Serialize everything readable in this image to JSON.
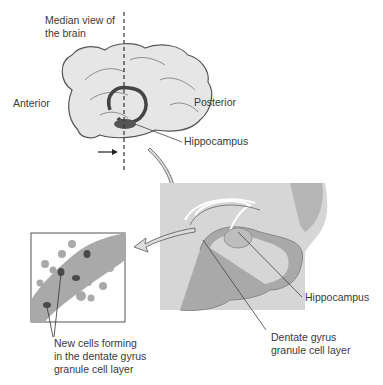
{
  "labels": {
    "median_view": [
      "Median view of",
      "the brain"
    ],
    "anterior": "Anterior",
    "posterior": "Posterior",
    "hippocampus_brain": "Hippocampus",
    "hippocampus_section": "Hippocampus",
    "dentate": [
      "Dentate gyrus",
      "granule cell layer"
    ],
    "new_cells": [
      "New cells forming",
      "in the dentate gyrus",
      "granule cell layer"
    ]
  },
  "colors": {
    "brain_fill": "#e6e6e6",
    "outline": "#555555",
    "section_bg": "#d6d6d6",
    "gray_matter": "#a9a9a9",
    "dark_cell": "#4a4a4a"
  }
}
